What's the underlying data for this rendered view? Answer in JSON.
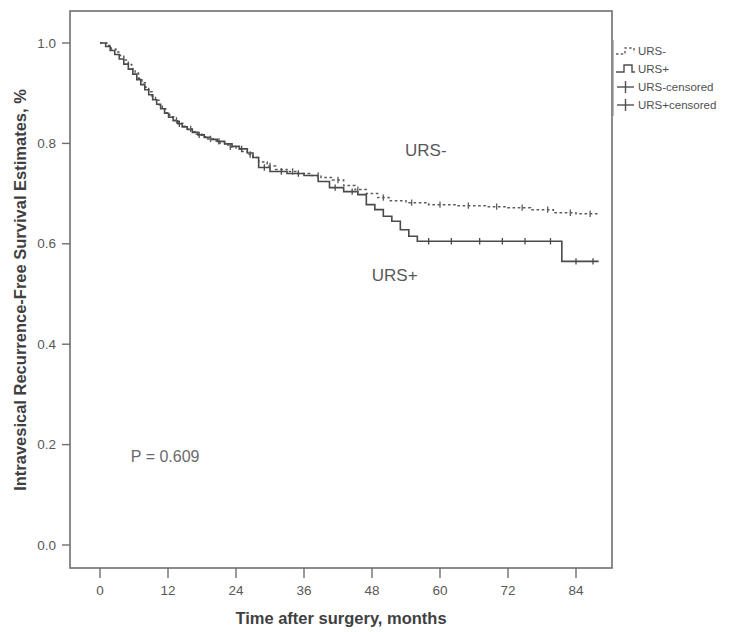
{
  "chart_data": {
    "type": "line",
    "subtype": "kaplan-meier-step",
    "title": "",
    "xlabel": "Time after surgery, months",
    "ylabel": "Intravesical Recurrence-Free Survival Estimates, %",
    "xlim": [
      -4,
      90
    ],
    "ylim": [
      0.0,
      1.05
    ],
    "xticks": [
      0,
      12,
      24,
      36,
      48,
      60,
      72,
      84
    ],
    "xticklabels": [
      "0",
      "12",
      "24",
      "36",
      "48",
      "60",
      "72",
      "84"
    ],
    "yticks": [
      0.0,
      0.2,
      0.4,
      0.6,
      0.8,
      1.0
    ],
    "yticklabels": [
      "0.0",
      "0.2",
      "0.4",
      "0.6",
      "0.8",
      "1.0"
    ],
    "grid": false,
    "legend_position": "top-right-outside",
    "annotations": [
      {
        "name": "pvalue",
        "text": "P = 0.609",
        "x": 11.5,
        "y": 0.165
      },
      {
        "name": "curve-label-urs-minus",
        "text": "URS-",
        "x": 57.5,
        "y": 0.775
      },
      {
        "name": "curve-label-urs-plus",
        "text": "URS+",
        "x": 52.0,
        "y": 0.525
      }
    ],
    "legend": [
      {
        "label": "URS-",
        "style": "dotted-step"
      },
      {
        "label": "URS+",
        "style": "solid-step"
      },
      {
        "label": "URS-censored",
        "style": "plus-marker"
      },
      {
        "label": "URS+censored",
        "style": "plus-marker"
      }
    ],
    "series": [
      {
        "name": "URS-",
        "style": "dotted",
        "final_value": 0.66,
        "points": [
          [
            0,
            1.0
          ],
          [
            1.2,
            0.995
          ],
          [
            2.0,
            0.988
          ],
          [
            2.8,
            0.982
          ],
          [
            3.5,
            0.975
          ],
          [
            4.2,
            0.966
          ],
          [
            5.0,
            0.957
          ],
          [
            5.6,
            0.948
          ],
          [
            6.2,
            0.94
          ],
          [
            6.8,
            0.93
          ],
          [
            7.4,
            0.921
          ],
          [
            8.0,
            0.912
          ],
          [
            8.6,
            0.903
          ],
          [
            9.2,
            0.894
          ],
          [
            9.8,
            0.886
          ],
          [
            10.4,
            0.877
          ],
          [
            11.0,
            0.869
          ],
          [
            11.6,
            0.861
          ],
          [
            12.3,
            0.853
          ],
          [
            13.0,
            0.846
          ],
          [
            13.8,
            0.84
          ],
          [
            14.6,
            0.834
          ],
          [
            15.4,
            0.829
          ],
          [
            16.2,
            0.823
          ],
          [
            17.0,
            0.818
          ],
          [
            18.0,
            0.813
          ],
          [
            19.0,
            0.809
          ],
          [
            20.0,
            0.805
          ],
          [
            21.0,
            0.801
          ],
          [
            22.0,
            0.797
          ],
          [
            23.0,
            0.793
          ],
          [
            24.0,
            0.789
          ],
          [
            25.0,
            0.784
          ],
          [
            26.0,
            0.778
          ],
          [
            27.0,
            0.772
          ],
          [
            28.0,
            0.763
          ],
          [
            29.5,
            0.755
          ],
          [
            31.0,
            0.748
          ],
          [
            33.0,
            0.744
          ],
          [
            35.0,
            0.74
          ],
          [
            37.0,
            0.736
          ],
          [
            39.0,
            0.732
          ],
          [
            41.0,
            0.727
          ],
          [
            43.0,
            0.716
          ],
          [
            45.0,
            0.708
          ],
          [
            47.0,
            0.7
          ],
          [
            49.0,
            0.692
          ],
          [
            51.0,
            0.686
          ],
          [
            54.0,
            0.682
          ],
          [
            58.0,
            0.678
          ],
          [
            63.0,
            0.676
          ],
          [
            68.0,
            0.674
          ],
          [
            72.0,
            0.672
          ],
          [
            76.0,
            0.668
          ],
          [
            80.0,
            0.662
          ],
          [
            84.0,
            0.66
          ],
          [
            88.0,
            0.66
          ]
        ],
        "censor_times": [
          13.5,
          16.0,
          19.5,
          23.0,
          26.5,
          30.0,
          34.0,
          38.5,
          42.0,
          45.5,
          50.0,
          55.0,
          60.0,
          65.0,
          70.0,
          74.5,
          79.0,
          83.0,
          86.5
        ]
      },
      {
        "name": "URS+",
        "style": "solid",
        "final_value": 0.565,
        "points": [
          [
            0,
            1.0
          ],
          [
            1.0,
            0.993
          ],
          [
            1.8,
            0.985
          ],
          [
            2.6,
            0.977
          ],
          [
            3.4,
            0.968
          ],
          [
            4.2,
            0.958
          ],
          [
            5.0,
            0.948
          ],
          [
            5.8,
            0.938
          ],
          [
            6.5,
            0.927
          ],
          [
            7.2,
            0.917
          ],
          [
            7.9,
            0.907
          ],
          [
            8.6,
            0.897
          ],
          [
            9.3,
            0.887
          ],
          [
            10.0,
            0.878
          ],
          [
            10.7,
            0.869
          ],
          [
            11.4,
            0.86
          ],
          [
            12.1,
            0.852
          ],
          [
            12.9,
            0.845
          ],
          [
            13.7,
            0.839
          ],
          [
            14.5,
            0.833
          ],
          [
            15.4,
            0.828
          ],
          [
            16.3,
            0.822
          ],
          [
            17.3,
            0.817
          ],
          [
            18.4,
            0.812
          ],
          [
            19.5,
            0.808
          ],
          [
            20.7,
            0.804
          ],
          [
            22.0,
            0.799
          ],
          [
            23.3,
            0.794
          ],
          [
            24.6,
            0.789
          ],
          [
            26.0,
            0.781
          ],
          [
            27.0,
            0.772
          ],
          [
            28.0,
            0.752
          ],
          [
            30.0,
            0.744
          ],
          [
            33.0,
            0.74
          ],
          [
            36.0,
            0.736
          ],
          [
            38.5,
            0.724
          ],
          [
            40.5,
            0.712
          ],
          [
            43.0,
            0.704
          ],
          [
            45.5,
            0.698
          ],
          [
            47.0,
            0.678
          ],
          [
            48.5,
            0.668
          ],
          [
            50.0,
            0.655
          ],
          [
            51.5,
            0.645
          ],
          [
            53.0,
            0.628
          ],
          [
            54.5,
            0.615
          ],
          [
            56.0,
            0.605
          ],
          [
            60.0,
            0.605
          ],
          [
            66.0,
            0.605
          ],
          [
            72.0,
            0.605
          ],
          [
            78.0,
            0.605
          ],
          [
            81.5,
            0.605
          ],
          [
            81.5,
            0.565
          ],
          [
            88.0,
            0.565
          ]
        ],
        "censor_times": [
          14.0,
          17.5,
          21.0,
          25.0,
          29.0,
          32.0,
          35.0,
          41.5,
          44.5,
          58.0,
          62.0,
          67.0,
          71.0,
          75.0,
          79.5,
          84.0,
          87.0
        ]
      }
    ]
  }
}
